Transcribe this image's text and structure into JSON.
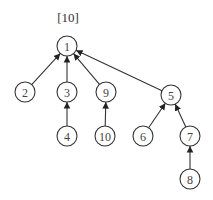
{
  "diagram": {
    "label": "[10]",
    "label_pos": {
      "x": 68,
      "y": 22
    },
    "radius": 10,
    "nodes": [
      {
        "id": "1",
        "x": 67,
        "y": 46
      },
      {
        "id": "2",
        "x": 25,
        "y": 92
      },
      {
        "id": "3",
        "x": 67,
        "y": 92
      },
      {
        "id": "9",
        "x": 106,
        "y": 92
      },
      {
        "id": "5",
        "x": 171,
        "y": 95
      },
      {
        "id": "4",
        "x": 67,
        "y": 136
      },
      {
        "id": "10",
        "x": 105,
        "y": 136
      },
      {
        "id": "6",
        "x": 143,
        "y": 136
      },
      {
        "id": "7",
        "x": 190,
        "y": 136
      },
      {
        "id": "8",
        "x": 190,
        "y": 179
      }
    ],
    "edges": [
      {
        "from": "2",
        "to": "1"
      },
      {
        "from": "3",
        "to": "1"
      },
      {
        "from": "9",
        "to": "1"
      },
      {
        "from": "5",
        "to": "1"
      },
      {
        "from": "4",
        "to": "3"
      },
      {
        "from": "10",
        "to": "9"
      },
      {
        "from": "6",
        "to": "5"
      },
      {
        "from": "7",
        "to": "5"
      },
      {
        "from": "8",
        "to": "7"
      }
    ]
  }
}
